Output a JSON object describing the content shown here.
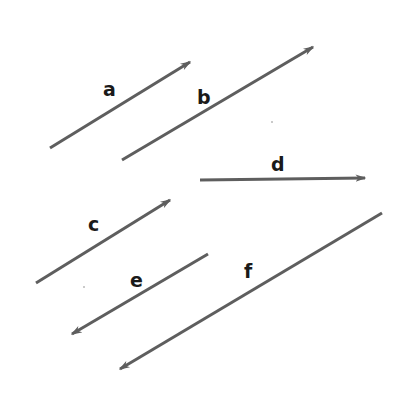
{
  "figure": {
    "background_color": "#ffffff",
    "width": 404,
    "height": 402,
    "stroke_color": "#5e5e5e",
    "label_color": "#1a1a1a",
    "stroke_width": 3
  },
  "vectors": [
    {
      "label": "a",
      "x1": 50,
      "y1": 148,
      "x2": 190,
      "y2": 62,
      "arrow_at": "end",
      "direction": "up-right",
      "label_x": 103,
      "label_y": 80
    },
    {
      "label": "b",
      "x1": 122,
      "y1": 160,
      "x2": 313,
      "y2": 47,
      "arrow_at": "end",
      "direction": "up-right",
      "label_x": 197,
      "label_y": 88
    },
    {
      "label": "c",
      "x1": 36,
      "y1": 283,
      "x2": 170,
      "y2": 200,
      "arrow_at": "end",
      "direction": "up-right",
      "label_x": 88,
      "label_y": 215
    },
    {
      "label": "d",
      "x1": 200,
      "y1": 180,
      "x2": 365,
      "y2": 178,
      "arrow_at": "end",
      "direction": "right",
      "label_x": 271,
      "label_y": 155
    },
    {
      "label": "e",
      "x1": 208,
      "y1": 254,
      "x2": 72,
      "y2": 334,
      "arrow_at": "end",
      "direction": "down-left",
      "label_x": 130,
      "label_y": 271
    },
    {
      "label": "f",
      "x1": 382,
      "y1": 213,
      "x2": 120,
      "y2": 369,
      "arrow_at": "end",
      "direction": "down-left",
      "label_x": 244,
      "label_y": 262
    }
  ],
  "specks": [
    {
      "x": 271,
      "y": 121
    },
    {
      "x": 83,
      "y": 286
    }
  ]
}
